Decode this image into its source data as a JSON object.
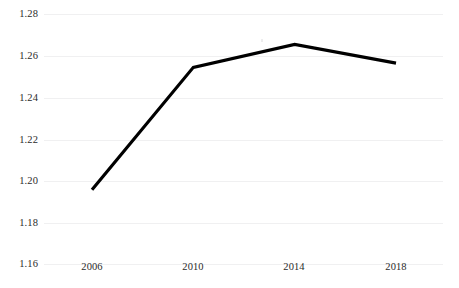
{
  "chart_data": {
    "type": "line",
    "title": "",
    "subtitle": "",
    "xlabel": "",
    "ylabel": "",
    "categories": [
      "2006",
      "2010",
      "2014",
      "2018"
    ],
    "x": [
      2006,
      2010,
      2014,
      2018
    ],
    "series": [
      {
        "name": "",
        "values": [
          1.196,
          1.2545,
          1.2655,
          1.2565
        ],
        "color": "#000000",
        "line_width_px": 3.2,
        "markers": false
      }
    ],
    "xtick_labels": [
      "2006",
      "2010",
      "2014",
      "2018"
    ],
    "ytick_labels": [
      "1.28",
      "1.26",
      "1.24",
      "1.22",
      "1.20",
      "1.18",
      "1.16"
    ],
    "ytick_values": [
      1.28,
      1.26,
      1.24,
      1.22,
      1.2,
      1.18,
      1.16
    ],
    "ylim": [
      1.16,
      1.28
    ],
    "xlim": [
      2006,
      2018
    ],
    "grid": {
      "horizontal": true,
      "vertical": false,
      "color": "#f0f0f1"
    },
    "legend": {
      "visible": false,
      "position": "none"
    },
    "axis_lines": {
      "left": false,
      "bottom": false,
      "top": false,
      "right": false
    },
    "background_color": "#ffffff",
    "tick_label_color": "#2b2b2b",
    "annotations": []
  }
}
